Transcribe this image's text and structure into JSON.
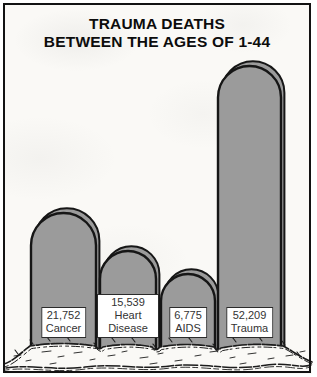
{
  "title": {
    "line1": "TRAUMA DEATHS",
    "line2": "BETWEEN THE AGES OF 1-44"
  },
  "chart_data": {
    "type": "bar",
    "title": "TRAUMA DEATHS BETWEEN THE AGES OF 1-44",
    "subtitle": "",
    "xlabel": "",
    "ylabel": "",
    "categories": [
      "Cancer",
      "Heart Disease",
      "AIDS",
      "Trauma"
    ],
    "values": [
      21752,
      15539,
      6775,
      52209
    ],
    "value_labels": [
      "21,752",
      "15,539",
      "6,775",
      "52,209"
    ],
    "ylim": [
      0,
      55000
    ],
    "grid": false,
    "legend_position": "none",
    "bar_style": "tombstone",
    "bars": [
      {
        "name": "Cancer",
        "value": 21752,
        "value_label": "21,752",
        "x": 31,
        "width": 65,
        "top": 213
      },
      {
        "name": "Heart Disease",
        "value": 15539,
        "value_label": "15,539",
        "x": 100,
        "width": 56,
        "top": 251
      },
      {
        "name": "AIDS",
        "value": 6775,
        "value_label": "6,775",
        "x": 161,
        "width": 54,
        "top": 274
      },
      {
        "name": "Trauma",
        "value": 52209,
        "value_label": "52,209",
        "x": 218,
        "width": 63,
        "top": 66
      }
    ],
    "base_y": 352
  },
  "colors": {
    "stone_fill": "#9b9b9b",
    "stone_outline": "#161616",
    "frame_border": "#121212",
    "paper_background": "#faf9f6",
    "label_background": "#ffffff",
    "label_border": "#2b2b2b",
    "label_text": "#333333",
    "title_text": "#0c0c0c",
    "grass_ink": "#1c1c1c"
  }
}
